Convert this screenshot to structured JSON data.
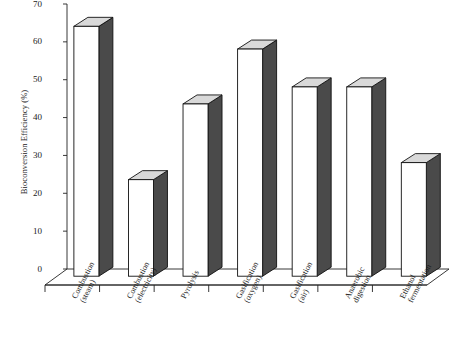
{
  "chart_data": {
    "type": "bar",
    "title": "",
    "xlabel": "",
    "ylabel": "Bioconversion Efficiency (%)",
    "categories": [
      "Combustion (steam)",
      "Combustion (electricity)",
      "Pyrolysis",
      "Gasification (oxygen)",
      "Gasification (air)",
      "Anaerobic digestion",
      "Ethanol fermentation"
    ],
    "category_lines": [
      [
        "Combustion",
        "(steam)"
      ],
      [
        "Combustion",
        "(electricity)"
      ],
      [
        "Pyrolysis",
        ""
      ],
      [
        "Gasification",
        "(oxygen)"
      ],
      [
        "Gasification",
        "(air)"
      ],
      [
        "Anaerobic",
        "digestion"
      ],
      [
        "Ethanol",
        "fermentation"
      ]
    ],
    "values": [
      66,
      25.5,
      45.5,
      60,
      50,
      50,
      30
    ],
    "ylim": [
      0,
      70
    ],
    "yticks": [
      0,
      10,
      20,
      30,
      40,
      50,
      60,
      70
    ],
    "ytick_labels": [
      "0",
      "10",
      "20",
      "30",
      "40",
      "50",
      "60",
      "70"
    ],
    "grid": false,
    "legend": "none",
    "style": "3d-column",
    "colors": {
      "bar_front": "#ffffff",
      "bar_side": "#4a4a4a",
      "bar_top": "#d9d9d9",
      "outline": "#111111",
      "axis": "#222222",
      "floor": "#ffffff",
      "text": "#1a1a1a"
    }
  },
  "axes": {
    "y_title": "Bioconversion Efficiency (%)"
  }
}
